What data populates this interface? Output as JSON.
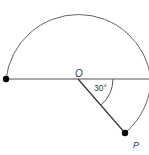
{
  "diagram": {
    "center_label": "O",
    "point_label": "P",
    "angle_label": "30°",
    "colors": {
      "stroke": "#555555",
      "point": "#000000",
      "text": "#333333"
    }
  }
}
